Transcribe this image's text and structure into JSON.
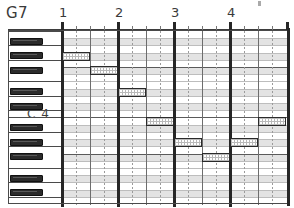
{
  "app": {
    "title": "Piano Roll Editor",
    "chord_label": "G7",
    "octave_label": "C 4"
  },
  "ruler": {
    "bars": [
      {
        "label": "1",
        "x": 62
      },
      {
        "label": "2",
        "x": 118
      },
      {
        "label": "3",
        "x": 174
      },
      {
        "label": "4",
        "x": 230
      }
    ],
    "beat_ticks_x": [
      76,
      90,
      104,
      132,
      146,
      160,
      188,
      202,
      216,
      244,
      258,
      272
    ],
    "end_x": 287
  },
  "keyboard": {
    "note_count": 24,
    "row_height": 7.208,
    "black_key_rows": [
      1,
      3,
      5,
      8,
      10,
      13,
      15,
      17,
      20,
      22
    ],
    "white_separator_rows": [
      0,
      2,
      4,
      7,
      9,
      11,
      12,
      14,
      16,
      19,
      21,
      23
    ],
    "c4_row": 12,
    "colors": {
      "black_key": "#2b2b2b",
      "white_key": "#ffffff",
      "outline": "#4a4a4a"
    }
  },
  "grid": {
    "columns": 16,
    "beats_per_bar": 4,
    "bars": 4,
    "shaded_rows": [
      1,
      3,
      5,
      8,
      10,
      13,
      15,
      17,
      20,
      22
    ],
    "octave_divider_rows": [
      0,
      5,
      12,
      17
    ],
    "colors": {
      "shade": "#e3e3e3",
      "line": "#bdbdbd",
      "bar_line": "#262626",
      "beat_line": "#6d6d6d"
    }
  },
  "chart_data": {
    "type": "piano-roll",
    "title": "G7",
    "xlabel": "Bars",
    "ylabel": "Pitch",
    "bars": 4,
    "beats_per_bar": 4,
    "pitch_rows": 24,
    "reference_note": "C 4",
    "notes": [
      {
        "id": "note-1",
        "row": 3,
        "start_beat": 0,
        "length_beats": 2,
        "x": 62,
        "y": 52,
        "w": 28,
        "h": 9
      },
      {
        "id": "note-2",
        "row": 5,
        "start_beat": 2,
        "length_beats": 2,
        "x": 90,
        "y": 66,
        "w": 28,
        "h": 9
      },
      {
        "id": "note-3",
        "row": 8,
        "start_beat": 4,
        "length_beats": 2,
        "x": 118,
        "y": 88,
        "w": 28,
        "h": 9
      },
      {
        "id": "note-4",
        "row": 12,
        "start_beat": 6,
        "length_beats": 2,
        "x": 146,
        "y": 117,
        "w": 28,
        "h": 9
      },
      {
        "id": "note-5",
        "row": 15,
        "start_beat": 8,
        "length_beats": 2,
        "x": 174,
        "y": 138,
        "w": 28,
        "h": 9
      },
      {
        "id": "note-6",
        "row": 17,
        "start_beat": 10,
        "length_beats": 2,
        "x": 202,
        "y": 153,
        "w": 28,
        "h": 9
      },
      {
        "id": "note-7",
        "row": 15,
        "start_beat": 12,
        "length_beats": 2,
        "x": 230,
        "y": 138,
        "w": 28,
        "h": 9
      },
      {
        "id": "note-8",
        "row": 12,
        "start_beat": 14,
        "length_beats": 2,
        "x": 258,
        "y": 117,
        "w": 28,
        "h": 9
      }
    ]
  }
}
